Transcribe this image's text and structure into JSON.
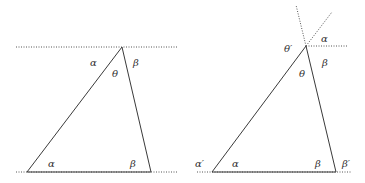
{
  "figure": {
    "left_panel": {
      "labels": {
        "top_alpha": "α",
        "top_theta": "θ",
        "top_beta": "β",
        "bottom_alpha": "α",
        "bottom_beta": "β"
      }
    },
    "right_panel": {
      "labels": {
        "theta_prime": "θ′",
        "top_alpha": "α",
        "top_beta": "β",
        "top_theta": "θ",
        "alpha_prime": "α′",
        "bottom_alpha": "α",
        "bottom_beta": "β",
        "beta_prime": "β′"
      }
    },
    "colors": {
      "line": "#3a3a3a",
      "text": "#333333",
      "background": "#ffffff"
    }
  }
}
